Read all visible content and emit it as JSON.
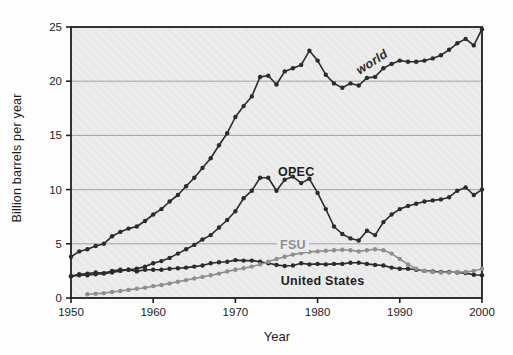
{
  "figure": {
    "y_axis_title": "Billion barrels per year",
    "x_axis_title": "Year"
  },
  "chart_data": {
    "type": "line",
    "title": "",
    "xlabel": "Year",
    "ylabel": "Billion barrels per year",
    "xlim": [
      1950,
      2000
    ],
    "ylim": [
      0,
      25
    ],
    "xticks": [
      1950,
      1960,
      1970,
      1980,
      1990,
      2000
    ],
    "yticks": [
      0,
      5,
      10,
      15,
      20,
      25
    ],
    "grid_y": [
      5,
      10,
      15,
      20
    ],
    "grid_on": true,
    "legend_position": "inline-labels",
    "plot_background": "#ececec",
    "frame_color": "#1f1f1f",
    "grid_color": "#9b9b9b",
    "x": [
      1950,
      1951,
      1952,
      1953,
      1954,
      1955,
      1956,
      1957,
      1958,
      1959,
      1960,
      1961,
      1962,
      1963,
      1964,
      1965,
      1966,
      1967,
      1968,
      1969,
      1970,
      1971,
      1972,
      1973,
      1974,
      1975,
      1976,
      1977,
      1978,
      1979,
      1980,
      1981,
      1982,
      1983,
      1984,
      1985,
      1986,
      1987,
      1988,
      1989,
      1990,
      1991,
      1992,
      1993,
      1994,
      1995,
      1996,
      1997,
      1998,
      1999,
      2000
    ],
    "series": [
      {
        "name": "world",
        "color": "#2b2b2b",
        "marker": "dot",
        "values": [
          3.8,
          4.3,
          4.5,
          4.8,
          5.0,
          5.7,
          6.1,
          6.4,
          6.6,
          7.1,
          7.7,
          8.2,
          8.9,
          9.5,
          10.3,
          11.1,
          12.0,
          12.9,
          14.1,
          15.2,
          16.7,
          17.7,
          18.6,
          20.4,
          20.5,
          19.7,
          20.9,
          21.2,
          21.5,
          22.8,
          21.9,
          20.6,
          19.8,
          19.4,
          19.8,
          19.6,
          20.3,
          20.4,
          21.2,
          21.6,
          21.9,
          21.8,
          21.8,
          21.9,
          22.1,
          22.4,
          22.9,
          23.5,
          23.9,
          23.3,
          24.8
        ]
      },
      {
        "name": "OPEC",
        "color": "#2b2b2b",
        "marker": "dot",
        "values": [
          2.0,
          2.1,
          2.1,
          2.2,
          2.25,
          2.35,
          2.5,
          2.6,
          2.7,
          2.9,
          3.2,
          3.4,
          3.7,
          4.1,
          4.5,
          4.9,
          5.4,
          5.8,
          6.5,
          7.2,
          8.0,
          9.2,
          9.9,
          11.1,
          11.1,
          9.9,
          10.9,
          11.2,
          10.6,
          11.0,
          9.7,
          8.2,
          6.6,
          5.9,
          5.5,
          5.3,
          6.2,
          5.8,
          7.0,
          7.7,
          8.2,
          8.5,
          8.7,
          8.9,
          9.0,
          9.1,
          9.3,
          9.9,
          10.2,
          9.5,
          10.0
        ]
      },
      {
        "name": "United States",
        "color": "#2b2b2b",
        "marker": "dot",
        "values": [
          2.0,
          2.2,
          2.25,
          2.35,
          2.3,
          2.5,
          2.6,
          2.6,
          2.45,
          2.6,
          2.6,
          2.6,
          2.7,
          2.75,
          2.8,
          2.9,
          3.0,
          3.2,
          3.3,
          3.35,
          3.5,
          3.45,
          3.45,
          3.35,
          3.2,
          3.05,
          2.95,
          3.0,
          3.2,
          3.1,
          3.15,
          3.1,
          3.15,
          3.15,
          3.25,
          3.25,
          3.15,
          3.05,
          3.0,
          2.8,
          2.7,
          2.7,
          2.6,
          2.5,
          2.45,
          2.4,
          2.4,
          2.35,
          2.3,
          2.15,
          2.1
        ]
      },
      {
        "name": "FSU",
        "color": "#8f8f8f",
        "marker": "dot",
        "values": [
          null,
          null,
          0.35,
          0.4,
          0.45,
          0.55,
          0.65,
          0.75,
          0.85,
          0.95,
          1.1,
          1.2,
          1.35,
          1.5,
          1.65,
          1.8,
          1.95,
          2.1,
          2.25,
          2.45,
          2.6,
          2.75,
          2.9,
          3.1,
          3.35,
          3.6,
          3.8,
          4.0,
          4.15,
          4.25,
          4.3,
          4.35,
          4.4,
          4.45,
          4.4,
          4.3,
          4.4,
          4.5,
          4.4,
          4.1,
          3.6,
          3.1,
          2.7,
          2.5,
          2.4,
          2.35,
          2.35,
          2.4,
          2.4,
          2.5,
          2.7
        ]
      }
    ],
    "annotations": [
      {
        "text": "world",
        "year": 1986.6,
        "value": 21.8,
        "rotation": -33,
        "color": "#2b2b2b",
        "style": "italic"
      },
      {
        "text": "OPEC",
        "year": 1977.4,
        "value": 11.6,
        "rotation": 0,
        "color": "#1f1f1f",
        "style": "bold"
      },
      {
        "text": "FSU",
        "year": 1977.0,
        "value": 4.9,
        "rotation": 0,
        "color": "#8f8f8f",
        "style": "bold",
        "mask": true
      },
      {
        "text": "United States",
        "year": 1980.6,
        "value": 1.55,
        "rotation": 0,
        "color": "#1f1f1f",
        "style": "bold"
      }
    ]
  }
}
